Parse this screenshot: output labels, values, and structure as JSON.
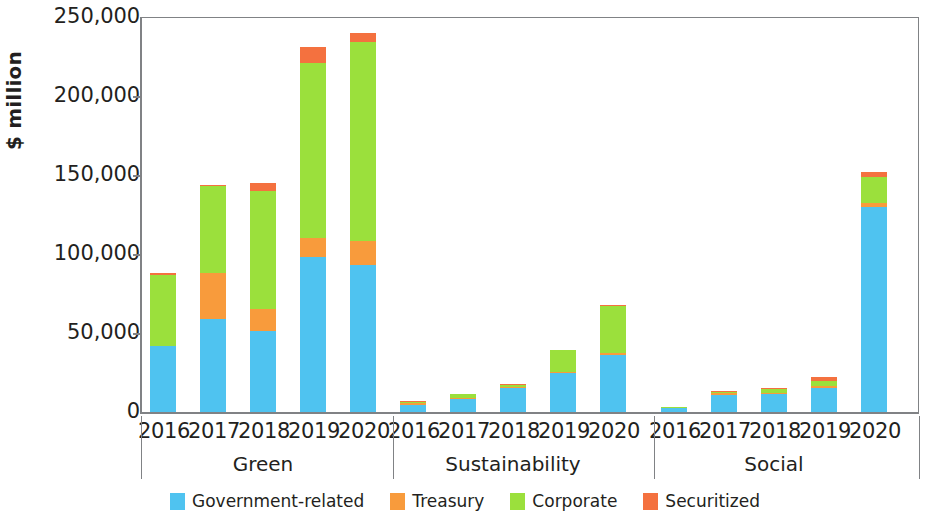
{
  "chart_data": {
    "type": "bar",
    "subtype": "stacked-grouped",
    "title": "",
    "xlabel": "",
    "ylabel": "$ million",
    "ylim": [
      0,
      250000
    ],
    "yticks": [
      0,
      50000,
      100000,
      150000,
      200000,
      250000
    ],
    "ytick_labels": [
      "0",
      "50,000",
      "100,000",
      "150,000",
      "200,000",
      "250,000"
    ],
    "grid": false,
    "legend_position": "bottom",
    "categories": [
      "2016",
      "2017",
      "2018",
      "2019",
      "2020"
    ],
    "groups": [
      "Green",
      "Sustainability",
      "Social"
    ],
    "series_names": [
      "Government-related",
      "Treasury",
      "Corporate",
      "Securitized"
    ],
    "series_colors": [
      "#4FC3F0",
      "#F89B3C",
      "#9BE03C",
      "#F4713F"
    ],
    "series": [
      {
        "name": "Government-related",
        "color": "#4FC3F0",
        "values": {
          "Green": [
            42000,
            59000,
            51000,
            98000,
            93000
          ],
          "Sustainability": [
            4500,
            8000,
            15000,
            24500,
            36000
          ],
          "Social": [
            2500,
            11000,
            11500,
            15000,
            130000
          ]
        }
      },
      {
        "name": "Treasury",
        "color": "#F89B3C",
        "values": {
          "Green": [
            0,
            29000,
            14000,
            12000,
            15000
          ],
          "Sustainability": [
            1000,
            500,
            800,
            500,
            1500
          ],
          "Social": [
            0,
            500,
            800,
            1500,
            2000
          ]
        }
      },
      {
        "name": "Corporate",
        "color": "#9BE03C",
        "values": {
          "Green": [
            45000,
            55000,
            75000,
            111000,
            126000
          ],
          "Sustainability": [
            500,
            2500,
            1200,
            14000,
            29500
          ],
          "Social": [
            300,
            1000,
            2000,
            3000,
            17000
          ]
        }
      },
      {
        "name": "Securitized",
        "color": "#F4713F",
        "values": {
          "Green": [
            1000,
            1000,
            5000,
            10000,
            6000
          ],
          "Sustainability": [
            300,
            0,
            300,
            0,
            300
          ],
          "Social": [
            0,
            300,
            700,
            2500,
            3000
          ]
        }
      }
    ],
    "group_totals": {
      "Green": [
        88000,
        144000,
        145000,
        231000,
        240000
      ],
      "Sustainability": [
        6300,
        11000,
        17300,
        39000,
        67300
      ],
      "Social": [
        2800,
        12800,
        15000,
        22000,
        152000
      ]
    }
  },
  "axis": {
    "y_title": "$ million",
    "y_tick_labels": [
      "250,000",
      "200,000",
      "150,000",
      "100,000",
      "50,000",
      "0"
    ]
  },
  "groups": [
    {
      "label": "Green",
      "years": [
        "2016",
        "2017",
        "2018",
        "2019",
        "2020"
      ]
    },
    {
      "label": "Sustainability",
      "years": [
        "2016",
        "2017",
        "2018",
        "2019",
        "2020"
      ]
    },
    {
      "label": "Social",
      "years": [
        "2016",
        "2017",
        "2018",
        "2019",
        "2020"
      ]
    }
  ],
  "legend": {
    "items": [
      {
        "label": "Government-related",
        "color": "#4FC3F0"
      },
      {
        "label": "Treasury",
        "color": "#F89B3C"
      },
      {
        "label": "Corporate",
        "color": "#9BE03C"
      },
      {
        "label": "Securitized",
        "color": "#F4713F"
      }
    ]
  }
}
